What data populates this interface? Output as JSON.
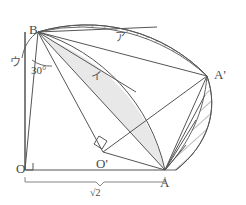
{
  "figure": {
    "type": "geometry-diagram",
    "points": {
      "B": {
        "label": "B",
        "x": 38,
        "y": 32
      },
      "A": {
        "label": "A",
        "x": 165,
        "y": 170
      },
      "Ap": {
        "label": "A'",
        "x": 207,
        "y": 76
      },
      "O": {
        "label": "O",
        "x": 25,
        "y": 170
      },
      "Op": {
        "label": "O'",
        "x": 103,
        "y": 152
      }
    },
    "angles": {
      "at_B": "30°",
      "right_angle_at_O": "90°",
      "right_angle_at_Op": "90°"
    },
    "lengths": {
      "OA": "√2"
    },
    "regions": {
      "hatched": "ア",
      "shaded": "イ",
      "arc_at_B": "ウ"
    },
    "colors": {
      "stroke": "#555555",
      "label": "#4a4a4a",
      "shade_fill": "#e6e6e6",
      "hatch": "#6b6b6b",
      "background": "#ffffff"
    }
  }
}
